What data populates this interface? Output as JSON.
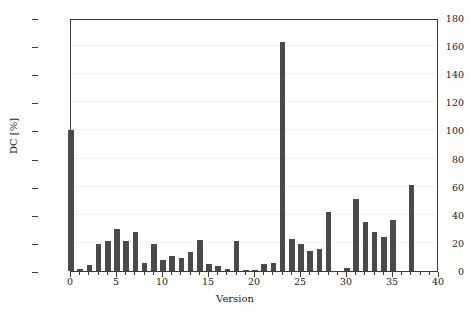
{
  "chart_data": {
    "type": "bar",
    "title": "",
    "xlabel": "Version",
    "ylabel": "DC [%]",
    "xlim": [
      0,
      40
    ],
    "ylim": [
      0,
      180
    ],
    "ytick_step": 20,
    "xtick_step": 1,
    "xtick_label_step": 5,
    "grid": true,
    "legend": null,
    "bar_color": "#4a4a4a",
    "axis_color": "#3b3b3b",
    "grid_color": "#f2f2f2",
    "background": "#ffffff",
    "ytick_labels": [
      "0",
      "20",
      "40",
      "60",
      "80",
      "100",
      "120",
      "140",
      "160",
      "180"
    ],
    "ytick_values": [
      0,
      20,
      40,
      60,
      80,
      100,
      120,
      140,
      160,
      180
    ],
    "xtick_labels": [
      "0",
      "5",
      "10",
      "15",
      "20",
      "25",
      "30",
      "35",
      "40"
    ],
    "xtick_values": [
      0,
      5,
      10,
      15,
      20,
      25,
      30,
      35,
      40
    ],
    "categories": [
      0,
      1,
      2,
      3,
      4,
      5,
      6,
      7,
      8,
      9,
      10,
      11,
      12,
      13,
      14,
      15,
      16,
      17,
      18,
      19,
      20,
      21,
      22,
      23,
      24,
      25,
      26,
      27,
      28,
      29,
      30,
      31,
      32,
      33,
      34,
      35,
      36,
      37
    ],
    "values": [
      100,
      1.5,
      4,
      19,
      21,
      30,
      21,
      28,
      6,
      19,
      8,
      11,
      9.5,
      13.5,
      22,
      5,
      3.5,
      1.5,
      21.5,
      1,
      0.5,
      5,
      6,
      163,
      23,
      19,
      14.5,
      15.5,
      42,
      0,
      2,
      51,
      35,
      28,
      24,
      36,
      0,
      61
    ]
  }
}
